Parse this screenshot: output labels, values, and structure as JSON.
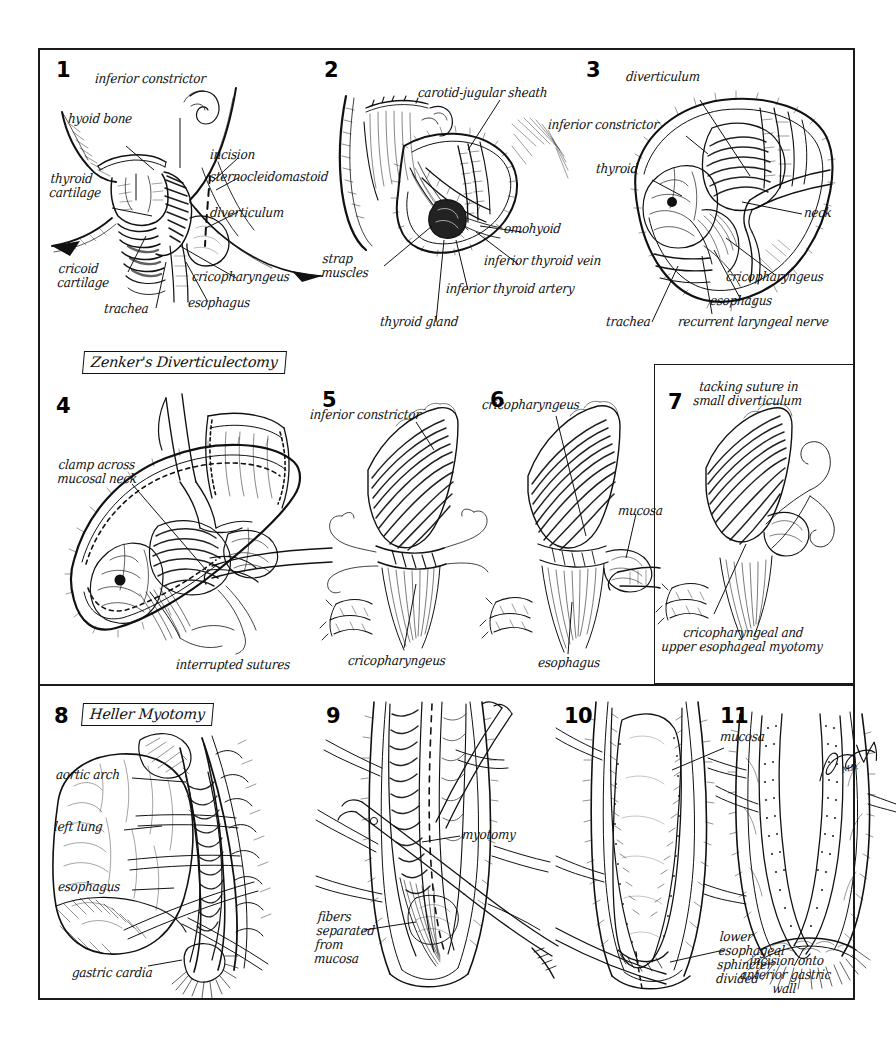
{
  "plate": {
    "title_boxes": [
      {
        "id": "zenker",
        "text": "Zenker's Diverticulectomy"
      },
      {
        "id": "heller",
        "text": "Heller Myotomy"
      }
    ],
    "signature": "M.D."
  },
  "panels": [
    {
      "number": "1",
      "name": "neck-anatomy-external",
      "labels": [
        "inferior constrictor",
        "hyoid bone",
        "incision",
        "sternocleidomastoid",
        "thyroid\ncartilage",
        "diverticulum",
        "cricoid\ncartilage",
        "cricopharyngeus",
        "trachea",
        "esophagus"
      ]
    },
    {
      "number": "2",
      "name": "neck-incision-exposure",
      "labels": [
        "carotid-jugular sheath",
        "omohyoid",
        "inferior thyroid vein",
        "strap\nmuscles",
        "inferior thyroid artery",
        "thyroid gland"
      ]
    },
    {
      "number": "3",
      "name": "diverticulum-exposure",
      "labels": [
        "diverticulum",
        "inferior constrictor",
        "thyroid",
        "neck",
        "cricopharyngeus",
        "esophagus",
        "trachea",
        "recurrent laryngeal nerve"
      ]
    },
    {
      "number": "4",
      "name": "clamp-and-suture",
      "labels": [
        "clamp across\nmucosal neck",
        "interrupted sutures"
      ]
    },
    {
      "number": "5",
      "name": "closure-inferior-constrictor",
      "labels": [
        "inferior constrictor",
        "cricopharyngeus"
      ]
    },
    {
      "number": "6",
      "name": "cricopharyngeal-myotomy",
      "labels": [
        "cricopharyngeus",
        "mucosa",
        "esophagus"
      ]
    },
    {
      "number": "7",
      "name": "tacking-suture-small-diverticulum",
      "labels": [
        "tacking suture in\nsmall diverticulum",
        "cricopharyngeal and\nupper esophageal myotomy"
      ]
    },
    {
      "number": "8",
      "name": "thoracic-exposure-esophagus",
      "labels": [
        "aortic arch",
        "left lung",
        "esophagus",
        "gastric cardia"
      ]
    },
    {
      "number": "9",
      "name": "myotomy-fiber-separation",
      "labels": [
        "myotomy",
        "fibers\nseparated\nfrom\nmucosa"
      ]
    },
    {
      "number": "10",
      "name": "mucosa-exposed-les-divided",
      "labels": [
        "mucosa",
        "lower\nesophageal\nsphincter\ndivided"
      ]
    },
    {
      "number": "11",
      "name": "incision-anterior-gastric-wall",
      "labels": [
        "incision onto\nanterior gastric\nwall"
      ]
    }
  ]
}
